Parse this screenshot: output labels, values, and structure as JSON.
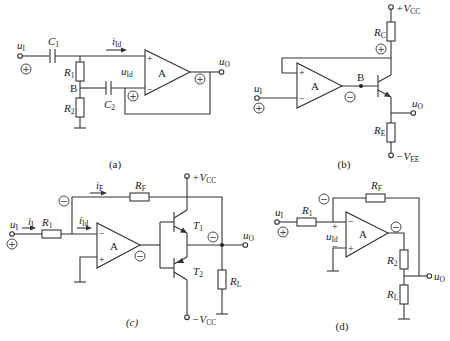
{
  "figure": {
    "panels": [
      {
        "id": "a",
        "caption": "(a)",
        "components": {
          "input": "u",
          "input_sub": "I",
          "c1": "C",
          "c1_sub": "1",
          "c2": "C",
          "c2_sub": "2",
          "r1": "R",
          "r1_sub": "1",
          "r2": "R",
          "r2_sub": "2",
          "node_b": "B",
          "current": "i",
          "current_sub": "Id",
          "diff_voltage": "u",
          "diff_voltage_sub": "Id",
          "opamp": "A",
          "opamp_plus": "+",
          "opamp_minus": "−",
          "output": "u",
          "output_sub": "O"
        },
        "polarities": [
          "+",
          "+",
          "+"
        ]
      },
      {
        "id": "b",
        "caption": "(b)",
        "components": {
          "vcc": "+V",
          "vcc_sub": "CC",
          "vee": "−V",
          "vee_sub": "EE",
          "rc": "R",
          "rc_sub": "C",
          "re": "R",
          "re_sub": "E",
          "node_b": "B",
          "input": "u",
          "input_sub": "I",
          "output": "u",
          "output_sub": "O",
          "opamp": "A",
          "opamp_plus": "+",
          "opamp_minus": "−"
        },
        "polarities": [
          "+",
          "−",
          "+"
        ]
      },
      {
        "id": "c",
        "caption": "(c)",
        "components": {
          "vcc_pos": "+V",
          "vcc_pos_sub": "CC",
          "vcc_neg": "−V",
          "vcc_neg_sub": "CC",
          "rf": "R",
          "rf_sub": "F",
          "r1": "R",
          "r1_sub": "1",
          "rl": "R",
          "rl_sub": "L",
          "t1": "T",
          "t1_sub": "1",
          "t2": "T",
          "t2_sub": "2",
          "current_in": "i",
          "current_in_sub": "I",
          "current_f": "i",
          "current_f_sub": "F",
          "current_id": "i",
          "current_id_sub": "Id",
          "input": "u",
          "input_sub": "I",
          "output": "u",
          "output_sub": "O",
          "opamp": "A",
          "opamp_plus": "+",
          "opamp_minus": "−"
        },
        "polarities": [
          "+",
          "−",
          "−",
          "−"
        ]
      },
      {
        "id": "d",
        "caption": "(d)",
        "components": {
          "rf": "R",
          "rf_sub": "F",
          "r1": "R",
          "r1_sub": "1",
          "r2": "R",
          "r2_sub": "2",
          "rl": "R",
          "rl_sub": "L",
          "input": "u",
          "input_sub": "I",
          "output": "u",
          "output_sub": "O",
          "diff_voltage": "u",
          "diff_voltage_sub": "Id",
          "diff_plus": "+",
          "diff_minus": "−",
          "opamp": "A",
          "opamp_plus": "+",
          "opamp_minus": "−"
        },
        "polarities": [
          "+",
          "−",
          "−"
        ]
      }
    ]
  }
}
